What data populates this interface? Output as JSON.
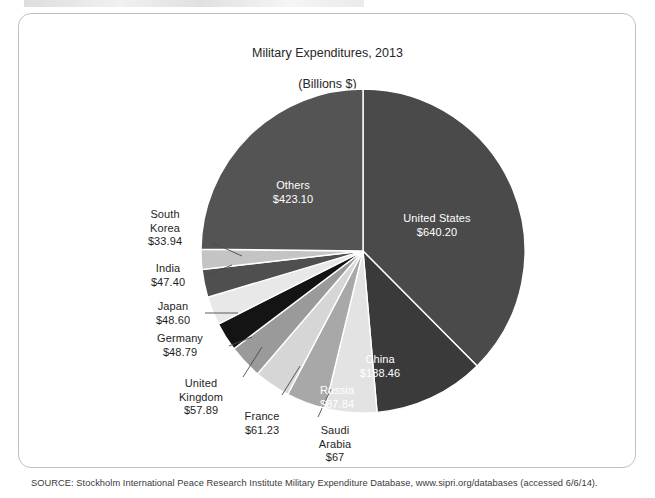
{
  "document": {
    "title_line1": "Military Expenditures, 2013",
    "title_line2": "(Billions $)",
    "source_note": "SOURCE: Stockholm International Peace Research Institute Military Expenditure Database, www.sipri.org/databases (accessed 6/6/14)."
  },
  "chart_data": {
    "type": "pie",
    "title": "Military Expenditures, 2013 (Billions $)",
    "unit": "Billions $",
    "legend": "none",
    "label_format": "name + $value",
    "start_angle_deg": 0,
    "direction": "clockwise",
    "categories": [
      "United States",
      "China",
      "Russia",
      "Saudi Arabia",
      "France",
      "United Kingdom",
      "Germany",
      "Japan",
      "India",
      "South Korea",
      "Others"
    ],
    "values": [
      640.2,
      188.46,
      87.84,
      67.0,
      61.23,
      57.89,
      48.79,
      48.6,
      47.4,
      33.94,
      423.1
    ],
    "slices": [
      {
        "name": "United States",
        "value": 640.2,
        "value_label": "$640.20",
        "color": "#4a4a4a",
        "label_placement": "inside"
      },
      {
        "name": "China",
        "value": 188.46,
        "value_label": "$188.46",
        "color": "#3a3a3a",
        "label_placement": "inside"
      },
      {
        "name": "Russia",
        "value": 87.84,
        "value_label": "$87.84",
        "color": "#e3e3e3",
        "label_placement": "inside"
      },
      {
        "name": "Saudi Arabia",
        "value": 67.0,
        "value_label": "$67",
        "color": "#a8a8a8",
        "label_placement": "outside"
      },
      {
        "name": "France",
        "value": 61.23,
        "value_label": "$61.23",
        "color": "#d6d6d6",
        "label_placement": "outside"
      },
      {
        "name": "United Kingdom",
        "value": 57.89,
        "value_label": "$57.89",
        "color": "#9a9a9a",
        "label_placement": "outside"
      },
      {
        "name": "Germany",
        "value": 48.79,
        "value_label": "$48.79",
        "color": "#141414",
        "label_placement": "outside"
      },
      {
        "name": "Japan",
        "value": 48.6,
        "value_label": "$48.60",
        "color": "#e8e8e8",
        "label_placement": "outside"
      },
      {
        "name": "India",
        "value": 47.4,
        "value_label": "$47.40",
        "color": "#4f4f4f",
        "label_placement": "outside"
      },
      {
        "name": "South Korea",
        "value": 33.94,
        "value_label": "$33.94",
        "color": "#c4c4c4",
        "label_placement": "outside"
      },
      {
        "name": "Others",
        "value": 423.1,
        "value_label": "$423.10",
        "color": "#545454",
        "label_placement": "inside"
      }
    ]
  },
  "labels": {
    "united_states": "United States\n$640.20",
    "china": "China\n$188.46",
    "russia": "Russia\n$87.84",
    "saudi_arabia": "Saudi\nArabia\n$67",
    "france": "France\n$61.23",
    "united_kingdom": "United\nKingdom\n$57.89",
    "germany": "Germany\n$48.79",
    "japan": "Japan\n$48.60",
    "india": "India\n$47.40",
    "south_korea": "South\nKorea\n$33.94",
    "others": "Others\n$423.10"
  }
}
